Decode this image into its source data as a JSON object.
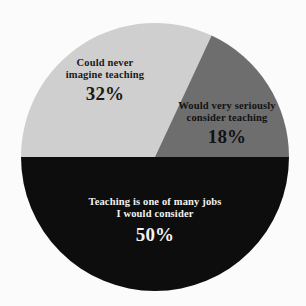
{
  "chart_data": {
    "type": "pie",
    "title": "",
    "subtitle": "",
    "xlabel": "",
    "ylabel": "",
    "legend_position": "none",
    "grid": false,
    "labels_inside_slices": true,
    "categories": [
      "Teaching is one of many jobs I would consider",
      "Could never imagine teaching",
      "Would very seriously consider teaching"
    ],
    "values": [
      50,
      32,
      18
    ],
    "value_labels": [
      "50%",
      "32%",
      "18%"
    ],
    "colors": [
      "#0d0d0d",
      "#cfcfcf",
      "#6e6e6e"
    ],
    "slices": [
      {
        "name": "teaching-one-of-many-jobs",
        "line1": "Teaching is one of many jobs",
        "line2": "I would consider",
        "percent_label": "50%",
        "value": 50,
        "color": "#0d0d0d",
        "text_color": "#f2f2f2",
        "start_angle_deg": 180,
        "end_angle_deg": 360
      },
      {
        "name": "could-never-imagine-teaching",
        "line1": "Could never",
        "line2": "imagine teaching",
        "percent_label": "32%",
        "value": 32,
        "color": "#cfcfcf",
        "text_color": "#1a1a1a",
        "start_angle_deg": 65,
        "end_angle_deg": 180
      },
      {
        "name": "would-very-seriously-consider-teaching",
        "line1": "Would very seriously",
        "line2": "consider teaching",
        "percent_label": "18%",
        "value": 18,
        "color": "#6e6e6e",
        "text_color": "#121212",
        "start_angle_deg": 0,
        "end_angle_deg": 65
      }
    ],
    "background_color": "#fbfbfb",
    "center_x": 155,
    "center_y": 157,
    "radius": 134
  }
}
